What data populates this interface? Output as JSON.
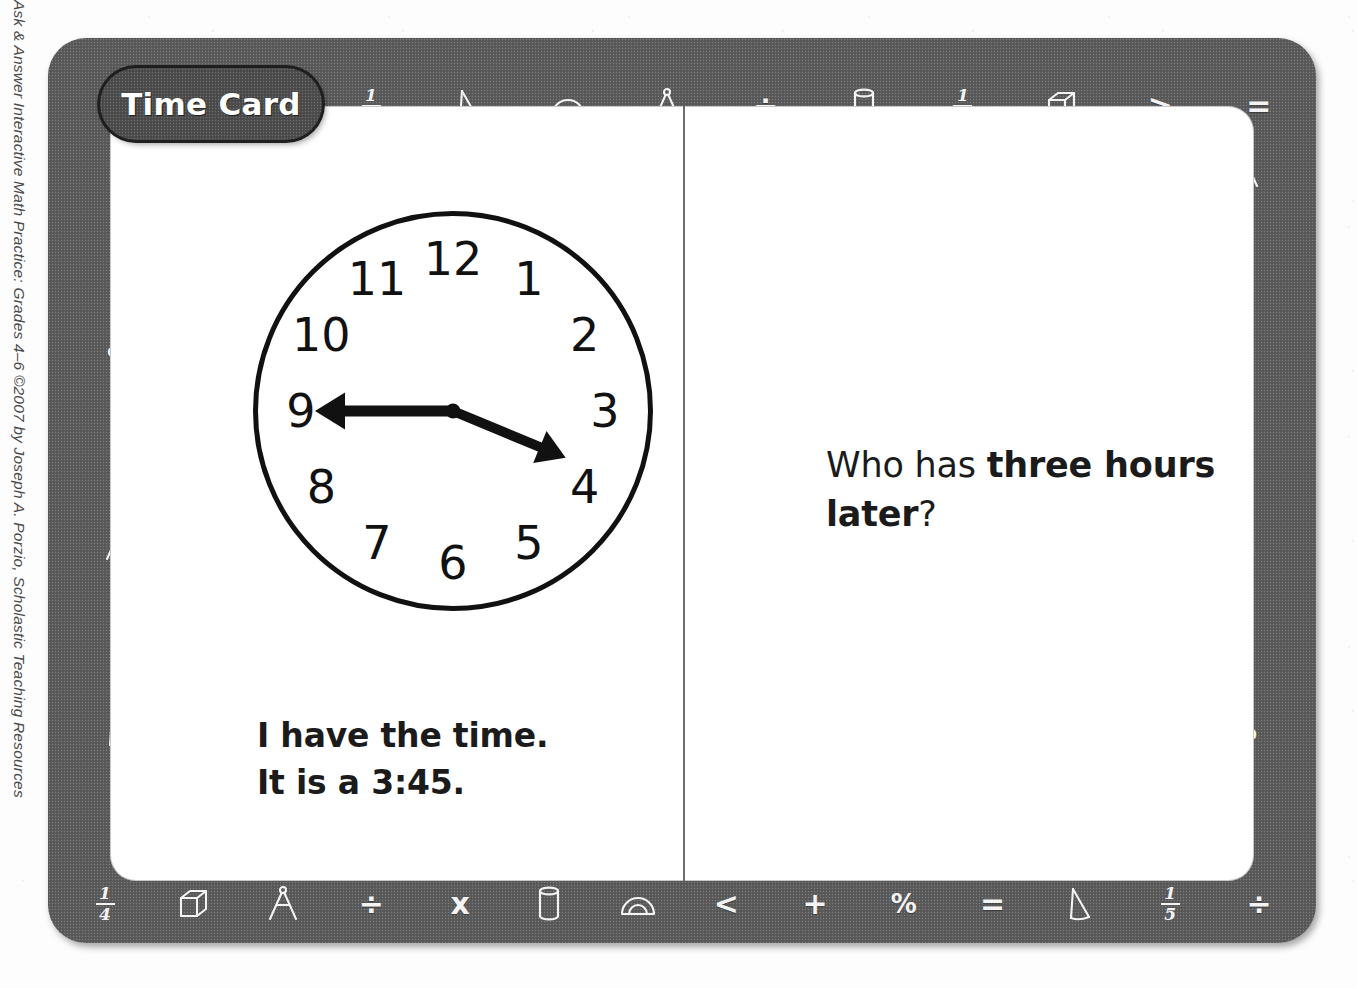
{
  "page": {
    "copyright": "Ask & Answer Interactive Math Practice: Grades 4–6 ©2007 by Joseph A. Porzio, Scholastic Teaching Resources"
  },
  "card": {
    "title": "Time Card",
    "frame_color": "#5c5c5c",
    "ink_color": "#111111",
    "paper_color": "#ffffff"
  },
  "answer": {
    "line1": "I have the time.",
    "line2_prefix": "It is a ",
    "line2_value": "3:45",
    "line2_suffix": "."
  },
  "question": {
    "prefix": "Who has ",
    "emphasis": "three hours later",
    "suffix": "?"
  },
  "clock": {
    "time": "3:45",
    "hour_hand_angle": 112.5,
    "minute_hand_angle": 270,
    "numerals": [
      "12",
      "1",
      "2",
      "3",
      "4",
      "5",
      "6",
      "7",
      "8",
      "9",
      "10",
      "11"
    ],
    "hand_style": "double-arrow"
  },
  "borders": {
    "top": [
      {
        "name": "fraction-one-third-icon",
        "kind": "fraction",
        "num": "1",
        "den": "3"
      },
      {
        "name": "cone-icon",
        "kind": "cone"
      },
      {
        "name": "protractor-icon",
        "kind": "protractor"
      },
      {
        "name": "compass-icon",
        "kind": "compass"
      },
      {
        "name": "divide-icon",
        "kind": "glyph",
        "char": "÷"
      },
      {
        "name": "cylinder-icon",
        "kind": "cylinder"
      },
      {
        "name": "fraction-one-half-icon",
        "kind": "fraction",
        "num": "1",
        "den": "2"
      },
      {
        "name": "cube-icon",
        "kind": "cube"
      },
      {
        "name": "greater-than-icon",
        "kind": "glyph",
        "char": ">"
      },
      {
        "name": "equals-icon",
        "kind": "glyph",
        "char": "="
      }
    ],
    "right": [
      {
        "name": "compass-icon",
        "kind": "compass"
      },
      {
        "name": "plus-icon",
        "kind": "glyph",
        "char": "+"
      },
      {
        "name": "cone-icon",
        "kind": "cone"
      },
      {
        "name": "divide-icon",
        "kind": "glyph",
        "char": "÷"
      },
      {
        "name": "cylinder-icon",
        "kind": "cylinder"
      },
      {
        "name": "multiply-icon",
        "kind": "glyph",
        "char": "x"
      },
      {
        "name": "percent-icon",
        "kind": "glyph",
        "char": "%"
      },
      {
        "name": "fraction-one-eighth-icon",
        "kind": "fraction",
        "num": "1",
        "den": "8"
      }
    ],
    "bottom": [
      {
        "name": "fraction-one-quarter-icon",
        "kind": "fraction",
        "num": "1",
        "den": "4"
      },
      {
        "name": "cube-icon",
        "kind": "cube"
      },
      {
        "name": "compass-icon",
        "kind": "compass"
      },
      {
        "name": "divide-icon",
        "kind": "glyph",
        "char": "÷"
      },
      {
        "name": "multiply-icon",
        "kind": "glyph",
        "char": "x"
      },
      {
        "name": "cylinder-icon",
        "kind": "cylinder"
      },
      {
        "name": "protractor-icon",
        "kind": "protractor"
      },
      {
        "name": "less-than-icon",
        "kind": "glyph",
        "char": "<"
      },
      {
        "name": "plus-icon",
        "kind": "glyph",
        "char": "+"
      },
      {
        "name": "percent-icon",
        "kind": "glyph",
        "char": "%"
      },
      {
        "name": "equals-icon",
        "kind": "glyph",
        "char": "="
      },
      {
        "name": "cone-icon",
        "kind": "cone"
      },
      {
        "name": "fraction-one-fifth-icon",
        "kind": "fraction",
        "num": "1",
        "den": "5"
      },
      {
        "name": "divide-icon",
        "kind": "glyph",
        "char": "÷"
      }
    ],
    "left": [
      {
        "name": "cylinder-icon",
        "kind": "cylinder"
      },
      {
        "name": "multiply-icon",
        "kind": "glyph",
        "char": "x"
      },
      {
        "name": "percent-icon",
        "kind": "glyph",
        "char": "%"
      },
      {
        "name": "equals-icon",
        "kind": "glyph",
        "char": "="
      },
      {
        "name": "compass-icon",
        "kind": "compass"
      },
      {
        "name": "divide-icon",
        "kind": "glyph",
        "char": "÷"
      },
      {
        "name": "cone-icon",
        "kind": "cone"
      },
      {
        "name": "plus-icon",
        "kind": "glyph",
        "char": "+"
      }
    ]
  }
}
